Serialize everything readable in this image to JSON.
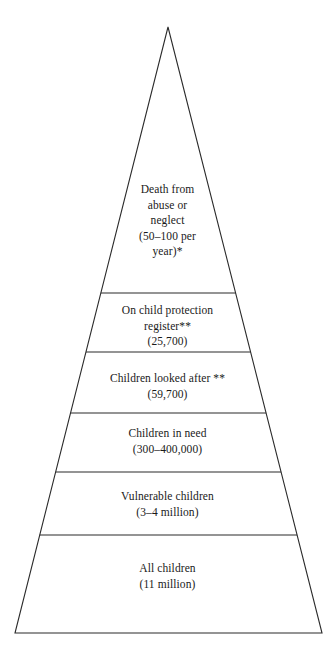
{
  "figure": {
    "name": "child-welfare-pyramid",
    "shape": "triangle",
    "apex": {
      "x": 168,
      "y": 27
    },
    "base_left": {
      "x": 15,
      "y": 633
    },
    "base_right": {
      "x": 322,
      "y": 633
    },
    "stroke_color": "#2b2b2b",
    "fill_color": "#ffffff",
    "background_color": "#ffffff"
  },
  "dividers": [
    {
      "name": "divider-1",
      "y": 293
    },
    {
      "name": "divider-2",
      "y": 352
    },
    {
      "name": "divider-3",
      "y": 413
    },
    {
      "name": "divider-4",
      "y": 472
    },
    {
      "name": "divider-5",
      "y": 535
    }
  ],
  "tiers": [
    {
      "name": "tier-death-from-abuse-or-neglect",
      "lines": [
        "Death from",
        "abuse or",
        "neglect",
        "(50–100 per",
        "year)*"
      ],
      "text_top": 182
    },
    {
      "name": "tier-on-child-protection-register",
      "lines": [
        "On child protection",
        "register**",
        "(25,700)"
      ],
      "text_top": 303
    },
    {
      "name": "tier-children-looked-after",
      "lines": [
        "Children looked after **",
        "(59,700)"
      ],
      "text_top": 371
    },
    {
      "name": "tier-children-in-need",
      "lines": [
        "Children in need",
        "(300–400,000)"
      ],
      "text_top": 426
    },
    {
      "name": "tier-vulnerable-children",
      "lines": [
        "Vulnerable children",
        "(3–4 million)"
      ],
      "text_top": 489
    },
    {
      "name": "tier-all-children",
      "lines": [
        "All children",
        "(11 million)"
      ],
      "text_top": 561
    }
  ]
}
